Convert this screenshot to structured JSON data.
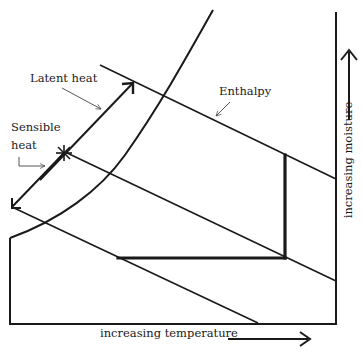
{
  "diagram": {
    "type": "psychrometric-chart-sketch",
    "labels": {
      "latent_heat": "Latent heat",
      "sensible_heat_line1": "Sensible",
      "sensible_heat_line2": "heat",
      "enthalpy": "Enthalpy",
      "x_axis": "increasing temperature",
      "y_axis": "increasing moisture"
    },
    "caption": "Figure: psychrometric chart showing sensible and latent heat",
    "colors": {
      "ink": "#1a1a1a",
      "background": "#ffffff",
      "caption_faded": "#d4d4d4"
    }
  }
}
